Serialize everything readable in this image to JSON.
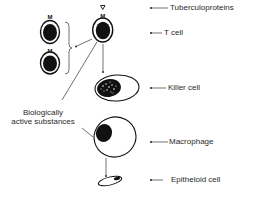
{
  "diagram": {
    "type": "cell-mediated immunity flow",
    "labels": {
      "tuberculoproteins": "Tuberculoproteins",
      "t_cell": "T cell",
      "killer_cell": "Killer cell",
      "macrophage": "Macrophage",
      "epitheloid_cell": "Epitheloid cell",
      "biologically_active_line1": "Biologically",
      "biologically_active_line2": "active substances"
    },
    "glyphs": {
      "antigen_marker": "∇",
      "receptor_marker": "M"
    },
    "colors": {
      "ink": "#111111",
      "background": "#ffffff",
      "text": "#2a2a2a"
    }
  }
}
